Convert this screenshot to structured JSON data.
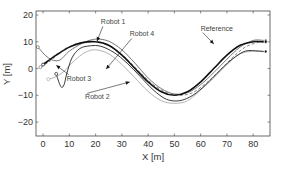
{
  "chart_data": {
    "type": "line",
    "title": "",
    "xlabel": "X [m]",
    "ylabel": "Y [m]",
    "xlim": [
      -2.7,
      86.4
    ],
    "ylim": [
      -25.2,
      21.5
    ],
    "xticks": [
      0,
      10,
      20,
      30,
      40,
      50,
      60,
      70,
      80
    ],
    "yticks": [
      20,
      10,
      0,
      -10,
      -20
    ],
    "grid": false,
    "legend": "annotations",
    "series": [
      {
        "name": "Reference",
        "color": "#111111",
        "width": 1.6,
        "dash": "",
        "x": [
          0,
          5,
          10,
          15,
          20,
          25,
          30,
          35,
          40,
          45,
          50,
          55,
          60,
          65,
          70,
          75,
          80,
          84
        ],
        "y": [
          1.5,
          5.0,
          8.0,
          9.7,
          10.0,
          8.7,
          5.0,
          0.0,
          -5.0,
          -8.7,
          -10.0,
          -8.7,
          -5.0,
          0.0,
          5.0,
          8.7,
          10.0,
          10.0
        ]
      },
      {
        "name": "Robot 1",
        "color": "#666666",
        "width": 0.9,
        "dash": "",
        "x": [
          -2,
          2,
          6,
          10,
          15,
          20,
          25,
          30,
          35,
          40,
          45,
          50,
          55,
          60,
          65,
          70,
          75,
          80,
          84
        ],
        "y": [
          8,
          4,
          3,
          6.5,
          9.5,
          11,
          10.2,
          7,
          2,
          -3.5,
          -7.5,
          -9.5,
          -9,
          -6,
          -1.5,
          3.5,
          8,
          10.5,
          10.5
        ]
      },
      {
        "name": "Robot 2",
        "color": "#aaaaaa",
        "width": 0.9,
        "dash": "",
        "x": [
          2,
          5,
          8,
          12,
          16,
          20,
          25,
          30,
          35,
          40,
          45,
          50,
          55,
          60,
          65,
          70,
          75,
          80,
          84
        ],
        "y": [
          -4,
          -3,
          -1,
          3,
          6,
          7,
          5.5,
          1.5,
          -3.5,
          -8.5,
          -12,
          -13,
          -12,
          -8,
          -3.5,
          1.5,
          5.5,
          6.5,
          6.5
        ]
      },
      {
        "name": "Robot 3",
        "color": "#222222",
        "width": 0.9,
        "dash": "",
        "x": [
          5,
          6,
          7,
          8,
          9,
          11,
          14,
          18,
          22,
          27,
          32,
          37,
          42,
          47,
          52,
          57,
          62,
          67,
          72,
          77,
          82,
          84
        ],
        "y": [
          -2,
          -5,
          -7,
          -6,
          -2,
          4,
          7.5,
          8.5,
          8.3,
          6,
          2,
          -3,
          -8,
          -11.5,
          -12,
          -10,
          -6,
          -1,
          3.5,
          6.5,
          6.5,
          6.3
        ]
      },
      {
        "name": "Robot 4",
        "color": "#777777",
        "width": 0.9,
        "dash": "3,2",
        "x": [
          -1,
          3,
          7,
          12,
          17,
          22,
          27,
          32,
          37,
          42,
          47,
          52,
          57,
          62,
          67,
          72,
          77,
          82,
          84
        ],
        "y": [
          0.5,
          3,
          6.5,
          9,
          10,
          9.8,
          7.5,
          3.5,
          -1.5,
          -6,
          -9,
          -10,
          -9,
          -5.5,
          -1,
          4,
          8,
          9.8,
          9.8
        ]
      }
    ],
    "annotations": [
      {
        "label": "Robot 1",
        "text_x": 22,
        "text_y": 16.5,
        "arrow_to": [
          20.5,
          10.2
        ]
      },
      {
        "label": "Robot 4",
        "text_x": 33,
        "text_y": 12,
        "arrow_to": [
          24,
          -0.2
        ]
      },
      {
        "label": "Reference",
        "text_x": 60,
        "text_y": 14.2,
        "arrow_to": [
          65,
          9.2
        ]
      },
      {
        "label": "Robot 3",
        "text_x": 9,
        "text_y": -4.5,
        "arrow_to": [
          5,
          1.2
        ]
      },
      {
        "label": "Robot 2",
        "text_x": 16,
        "text_y": -11.5,
        "arrow_to": [
          33,
          -5
        ]
      }
    ]
  }
}
